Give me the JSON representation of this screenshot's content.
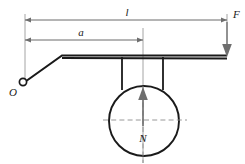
{
  "figure": {
    "background_color": "#ffffff",
    "width": 245,
    "height": 164
  },
  "labels": {
    "length_total": "l",
    "length_partial": "a",
    "force_applied": "F",
    "force_normal": "N",
    "pivot": "O"
  },
  "colors": {
    "beam_stroke": "#1a1a1a",
    "dimension_stroke": "#5a5a5a",
    "extension_stroke": "#9a9a9a",
    "force_stroke": "#6e6e6e",
    "centerline_stroke": "#8d8d8d",
    "label_fill": "#1a1a1a"
  },
  "geometry": {
    "dimension_l": {
      "x_start": 25,
      "x_end": 227,
      "y": 20
    },
    "dimension_a": {
      "x_start": 25,
      "x_end": 143,
      "y": 40
    },
    "pivot": {
      "cx": 23,
      "cy": 82,
      "r": 3.6
    },
    "beam": {
      "y_top": 55,
      "x_left_bend": 62,
      "x_right": 227
    },
    "wheel": {
      "cx": 144,
      "cy": 121,
      "r": 35
    },
    "support_legs": {
      "x_left": 122,
      "x_right": 163,
      "y_top": 56,
      "y_bottom": 88
    },
    "force_F": {
      "x": 227,
      "y_start": 22,
      "y_end": 56
    },
    "force_N": {
      "x": 143,
      "y_start": 124,
      "y_end": 88
    },
    "centerline_horizontal": {
      "x_start": 103,
      "x_end": 187,
      "y": 120
    },
    "centerline_vertical": {
      "x": 143,
      "y_start": 28,
      "y_end": 163
    }
  },
  "annotations": {
    "l_label_pos": {
      "x": 127,
      "y": 16
    },
    "a_label_pos": {
      "x": 81,
      "y": 36
    },
    "F_label_pos": {
      "x": 232,
      "y": 18
    },
    "N_label_pos": {
      "x": 140,
      "y": 140
    },
    "O_label_pos": {
      "x": 12,
      "y": 95
    }
  }
}
